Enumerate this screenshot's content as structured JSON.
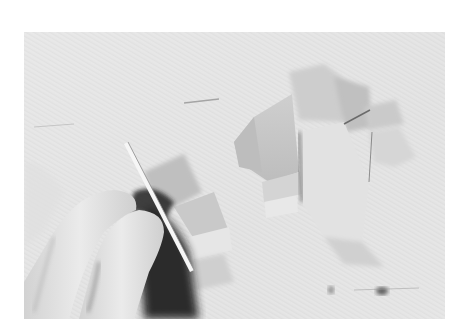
{
  "photo": {
    "description": "Black-and-white photo of a hand holding a knife, cutting vegetable pieces (leek/onion chunks) on a wooden cutting board",
    "alt": "Hand cutting vegetable pieces with a knife on a cutting board",
    "colors": {
      "board": "#e4e4e4",
      "board_light": "#efefef",
      "shadow": "#2a2a2a",
      "vegetable": "#c4c4c4",
      "vegetable_light": "#d8d8d8",
      "hand": "#dcdcdc"
    }
  },
  "caption": {
    "text": ""
  }
}
